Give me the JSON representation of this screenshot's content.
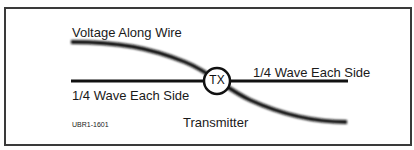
{
  "diagram": {
    "title": "Voltage Along Wire",
    "left_label": "1/4 Wave Each Side",
    "right_label": "1/4 Wave Each Side",
    "center_node": "TX",
    "center_caption": "Transmitter",
    "figure_code": "UBR1-1601",
    "colors": {
      "line": "#111111",
      "frame": "#3a3a3a",
      "background": "#ffffff"
    }
  }
}
